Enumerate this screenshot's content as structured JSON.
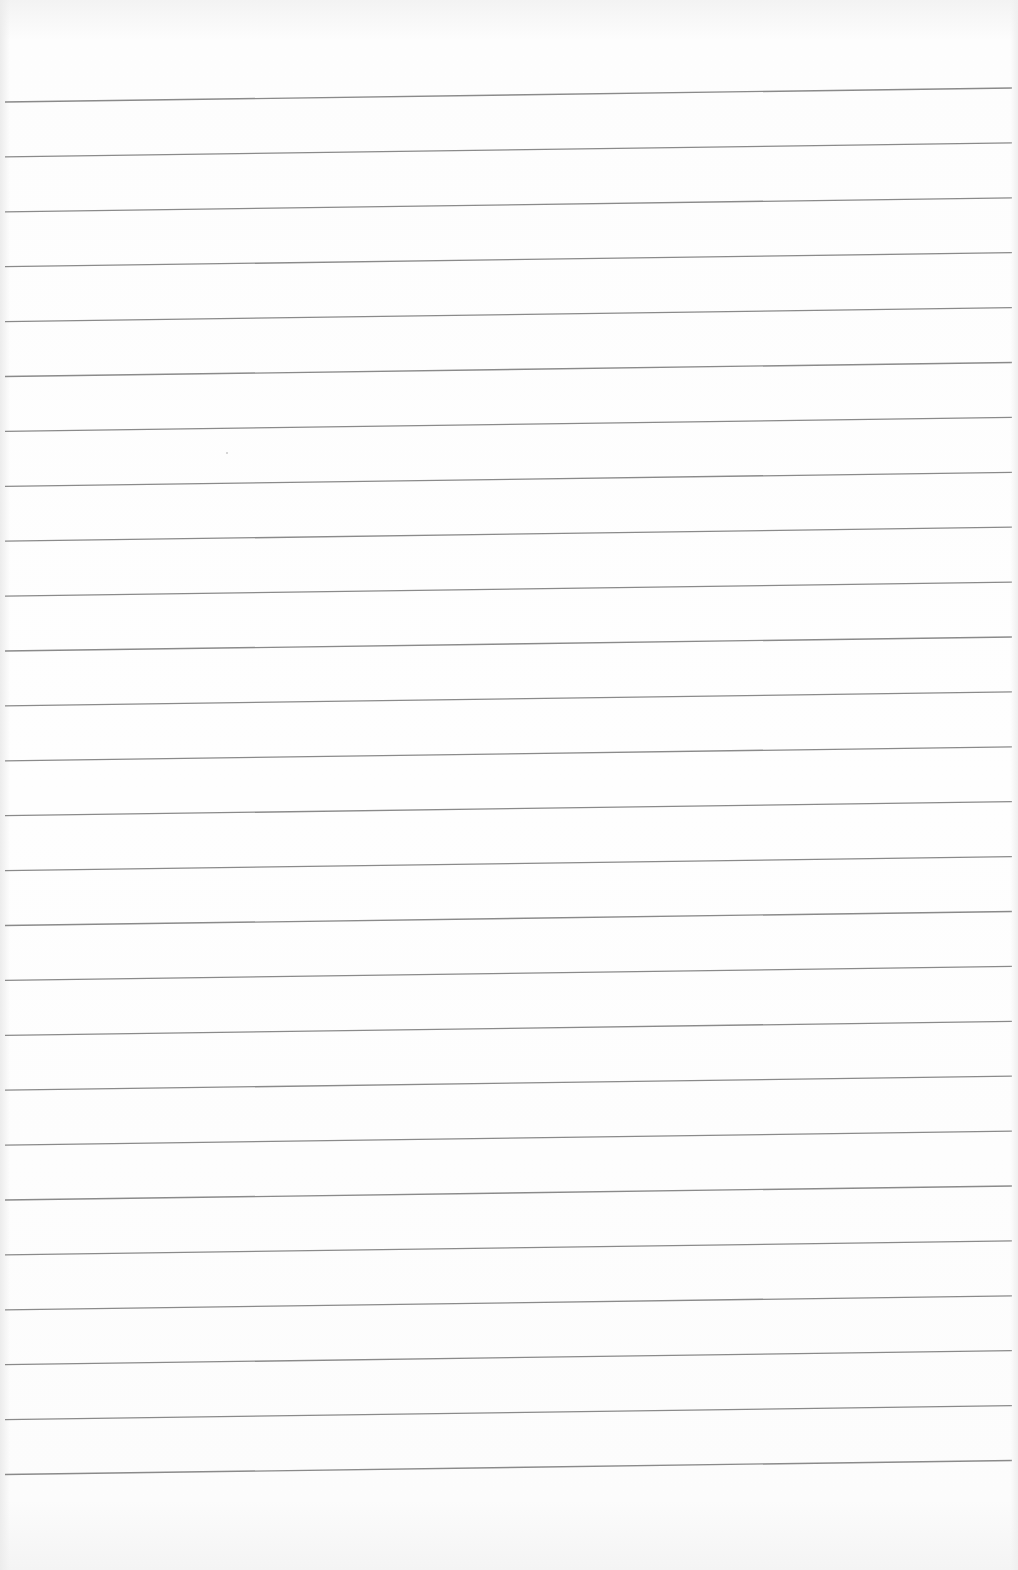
{
  "document": {
    "type": "ruled-paper",
    "text_content": "",
    "background_color": "#fdfdfd",
    "rule_color": "#8a8a8a",
    "rule_count": 26,
    "rule_spacing_px": 54.9,
    "first_rule_y_left": 102,
    "first_rule_y_right": 88,
    "rule_x_start": 5,
    "rule_x_end": 1012
  }
}
